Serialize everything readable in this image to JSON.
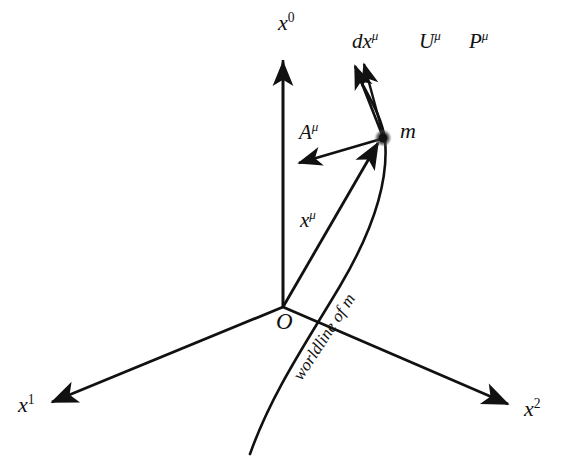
{
  "figure": {
    "background_color": "#ffffff",
    "ink_color": "#111111",
    "width": 577,
    "height": 457
  },
  "axes": [
    {
      "id": "x0",
      "base": "x",
      "exponent": "0",
      "exponent_italic": false,
      "description": "time axis pointing up"
    },
    {
      "id": "x1",
      "base": "x",
      "exponent": "1",
      "exponent_italic": false,
      "description": "space axis pointing lower-left"
    },
    {
      "id": "x2",
      "base": "x",
      "exponent": "2",
      "exponent_italic": false,
      "description": "space axis pointing lower-right"
    }
  ],
  "origin": {
    "label": "O"
  },
  "particle": {
    "label": "m",
    "marker": "filled-dot"
  },
  "vectors": [
    {
      "id": "position",
      "base": "x",
      "exponent": "μ",
      "exponent_italic": true,
      "description": "position four-vector from origin to particle"
    },
    {
      "id": "acceleration",
      "base": "A",
      "exponent": "μ",
      "exponent_italic": true,
      "description": "four-acceleration pointing left from particle"
    },
    {
      "id": "displacement",
      "base": "dx",
      "exponent": "μ",
      "exponent_italic": true,
      "description": "infinitesimal displacement tangent to worldline"
    },
    {
      "id": "velocity",
      "base": "U",
      "exponent": "μ",
      "exponent_italic": true,
      "description": "four-velocity tangent to worldline"
    },
    {
      "id": "momentum",
      "base": "P",
      "exponent": "μ",
      "exponent_italic": true,
      "description": "four-momentum tangent to worldline"
    }
  ],
  "curve": {
    "label": "worldline of m"
  }
}
